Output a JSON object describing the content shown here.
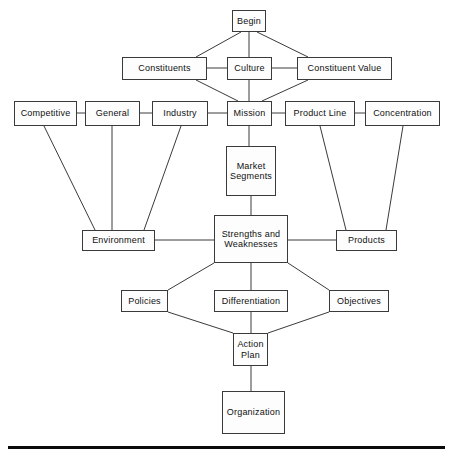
{
  "diagram": {
    "colors": {
      "background": "#ffffff",
      "node_fill": "#fdfdfd",
      "node_border": "#3a3a3a",
      "edge": "#3a3a3a",
      "rule": "#0a0a0a",
      "text": "#101010"
    },
    "nodes": [
      {
        "id": "begin",
        "label": "Begin",
        "x": 232,
        "y": 10,
        "w": 34,
        "h": 22
      },
      {
        "id": "constituents",
        "label": "Constituents",
        "x": 122,
        "y": 57,
        "w": 85,
        "h": 23
      },
      {
        "id": "culture",
        "label": "Culture",
        "x": 227,
        "y": 57,
        "w": 45,
        "h": 23
      },
      {
        "id": "constituent_value",
        "label": "Constituent Value",
        "x": 297,
        "y": 57,
        "w": 95,
        "h": 23
      },
      {
        "id": "competitive",
        "label": "Competitive",
        "x": 14,
        "y": 101,
        "w": 63,
        "h": 25
      },
      {
        "id": "general",
        "label": "General",
        "x": 85,
        "y": 101,
        "w": 55,
        "h": 25
      },
      {
        "id": "industry",
        "label": "Industry",
        "x": 152,
        "y": 101,
        "w": 56,
        "h": 25
      },
      {
        "id": "mission",
        "label": "Mission",
        "x": 227,
        "y": 101,
        "w": 45,
        "h": 25
      },
      {
        "id": "product_line",
        "label": "Product Line",
        "x": 285,
        "y": 101,
        "w": 70,
        "h": 25
      },
      {
        "id": "concentration",
        "label": "Concentration",
        "x": 365,
        "y": 101,
        "w": 75,
        "h": 25
      },
      {
        "id": "market_segments",
        "label": "Market\nSegments",
        "x": 226,
        "y": 146,
        "w": 50,
        "h": 50
      },
      {
        "id": "environment",
        "label": "Environment",
        "x": 82,
        "y": 230,
        "w": 73,
        "h": 21
      },
      {
        "id": "strengths_weaknesses",
        "label": "Strengths and\nWeaknesses",
        "x": 214,
        "y": 215,
        "w": 74,
        "h": 48
      },
      {
        "id": "products",
        "label": "Products",
        "x": 336,
        "y": 230,
        "w": 61,
        "h": 21
      },
      {
        "id": "policies",
        "label": "Policies",
        "x": 121,
        "y": 290,
        "w": 47,
        "h": 22
      },
      {
        "id": "differentiation",
        "label": "Differentiation",
        "x": 214,
        "y": 290,
        "w": 74,
        "h": 22
      },
      {
        "id": "objectives",
        "label": "Objectives",
        "x": 329,
        "y": 290,
        "w": 60,
        "h": 22
      },
      {
        "id": "action_plan",
        "label": "Action\nPlan",
        "x": 233,
        "y": 333,
        "w": 35,
        "h": 33
      },
      {
        "id": "organization",
        "label": "Organization",
        "x": 222,
        "y": 391,
        "w": 63,
        "h": 43
      }
    ],
    "edges": [
      {
        "from": "begin",
        "to": "constituents",
        "x1": 241,
        "y1": 32,
        "x2": 196,
        "y2": 57
      },
      {
        "from": "begin",
        "to": "culture",
        "x1": 249,
        "y1": 32,
        "x2": 249,
        "y2": 57
      },
      {
        "from": "begin",
        "to": "constituent_value",
        "x1": 257,
        "y1": 32,
        "x2": 308,
        "y2": 57
      },
      {
        "from": "constituents",
        "to": "culture",
        "x1": 207,
        "y1": 68,
        "x2": 227,
        "y2": 68
      },
      {
        "from": "culture",
        "to": "constituent_value",
        "x1": 272,
        "y1": 68,
        "x2": 297,
        "y2": 68
      },
      {
        "from": "constituents",
        "to": "mission",
        "x1": 196,
        "y1": 80,
        "x2": 238,
        "y2": 101
      },
      {
        "from": "culture",
        "to": "mission",
        "x1": 249,
        "y1": 80,
        "x2": 249,
        "y2": 101
      },
      {
        "from": "constituent_value",
        "to": "mission",
        "x1": 308,
        "y1": 80,
        "x2": 262,
        "y2": 101
      },
      {
        "from": "competitive",
        "to": "general",
        "x1": 77,
        "y1": 113,
        "x2": 85,
        "y2": 113
      },
      {
        "from": "general",
        "to": "industry",
        "x1": 140,
        "y1": 113,
        "x2": 152,
        "y2": 113
      },
      {
        "from": "industry",
        "to": "mission",
        "x1": 208,
        "y1": 113,
        "x2": 227,
        "y2": 113
      },
      {
        "from": "mission",
        "to": "product_line",
        "x1": 272,
        "y1": 113,
        "x2": 285,
        "y2": 113
      },
      {
        "from": "product_line",
        "to": "concentration",
        "x1": 355,
        "y1": 113,
        "x2": 365,
        "y2": 113
      },
      {
        "from": "competitive",
        "to": "environment",
        "x1": 44,
        "y1": 126,
        "x2": 95,
        "y2": 230
      },
      {
        "from": "general",
        "to": "environment",
        "x1": 112,
        "y1": 126,
        "x2": 112,
        "y2": 230
      },
      {
        "from": "industry",
        "to": "environment",
        "x1": 181,
        "y1": 126,
        "x2": 144,
        "y2": 230
      },
      {
        "from": "product_line",
        "to": "products",
        "x1": 320,
        "y1": 126,
        "x2": 346,
        "y2": 230
      },
      {
        "from": "concentration",
        "to": "products",
        "x1": 403,
        "y1": 126,
        "x2": 386,
        "y2": 230
      },
      {
        "from": "mission",
        "to": "market_segments",
        "x1": 249,
        "y1": 126,
        "x2": 249,
        "y2": 146
      },
      {
        "from": "market_segments",
        "to": "strengths_weaknesses",
        "x1": 251,
        "y1": 196,
        "x2": 251,
        "y2": 215
      },
      {
        "from": "environment",
        "to": "strengths_weaknesses",
        "x1": 155,
        "y1": 240,
        "x2": 214,
        "y2": 240
      },
      {
        "from": "strengths_weaknesses",
        "to": "products",
        "x1": 288,
        "y1": 240,
        "x2": 336,
        "y2": 240
      },
      {
        "from": "strengths_weaknesses",
        "to": "policies",
        "x1": 214,
        "y1": 263,
        "x2": 168,
        "y2": 290
      },
      {
        "from": "strengths_weaknesses",
        "to": "differentiation",
        "x1": 251,
        "y1": 263,
        "x2": 251,
        "y2": 290
      },
      {
        "from": "strengths_weaknesses",
        "to": "objectives",
        "x1": 288,
        "y1": 263,
        "x2": 329,
        "y2": 290
      },
      {
        "from": "policies",
        "to": "action_plan",
        "x1": 168,
        "y1": 312,
        "x2": 233,
        "y2": 333
      },
      {
        "from": "differentiation",
        "to": "action_plan",
        "x1": 251,
        "y1": 312,
        "x2": 251,
        "y2": 333
      },
      {
        "from": "objectives",
        "to": "action_plan",
        "x1": 329,
        "y1": 312,
        "x2": 268,
        "y2": 333
      },
      {
        "from": "action_plan",
        "to": "organization",
        "x1": 251,
        "y1": 366,
        "x2": 251,
        "y2": 391
      }
    ],
    "footer_rule": {
      "x": 8,
      "y": 446,
      "w": 437,
      "h": 3
    }
  }
}
